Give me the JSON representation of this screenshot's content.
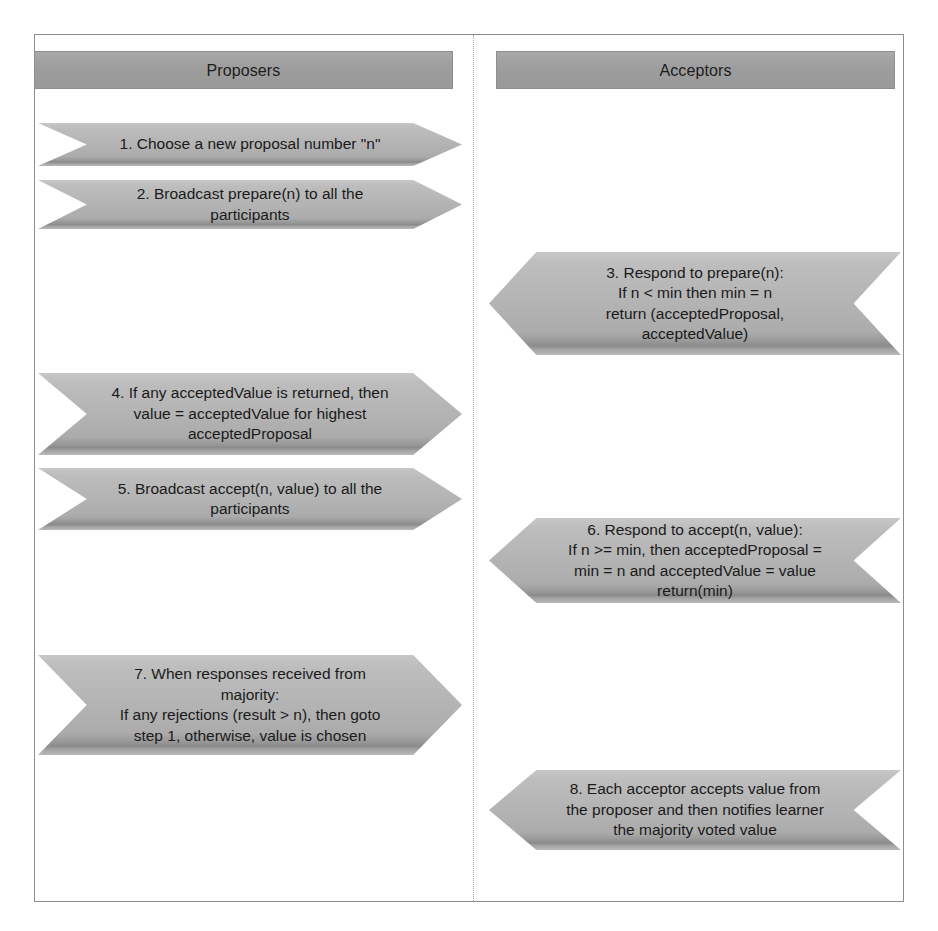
{
  "diagram": {
    "colors": {
      "header_fill": "#9d9d9d",
      "arrow_fill": "#b2b2b2",
      "arrow_shadow": "#8b8b8b",
      "frame_border": "#8d8d8d",
      "divider": "#a8a8a8",
      "text": "#1a1a1a"
    },
    "lanes": [
      {
        "id": "proposers",
        "label": "Proposers",
        "arrow_direction": "right"
      },
      {
        "id": "acceptors",
        "label": "Acceptors",
        "arrow_direction": "left"
      }
    ],
    "steps": [
      {
        "number": "1",
        "lane": "proposers",
        "direction": "right",
        "text": "1. Choose a new proposal number \"n\""
      },
      {
        "number": "2",
        "lane": "proposers",
        "direction": "right",
        "text": "2. Broadcast prepare(n) to all the\nparticipants"
      },
      {
        "number": "3",
        "lane": "acceptors",
        "direction": "left",
        "text": "3. Respond to prepare(n):\nIf n < min then min = n\nreturn (acceptedProposal,\nacceptedValue)"
      },
      {
        "number": "4",
        "lane": "proposers",
        "direction": "right",
        "text": "4. If any acceptedValue is returned, then\nvalue = acceptedValue for highest\nacceptedProposal"
      },
      {
        "number": "5",
        "lane": "proposers",
        "direction": "right",
        "text": "5. Broadcast accept(n, value) to all the\nparticipants"
      },
      {
        "number": "6",
        "lane": "acceptors",
        "direction": "left",
        "text": "6. Respond to accept(n, value):\nIf n >= min, then acceptedProposal =\nmin = n and acceptedValue = value\nreturn(min)"
      },
      {
        "number": "7",
        "lane": "proposers",
        "direction": "right",
        "text": "7. When responses received from\nmajority:\nIf any rejections (result > n), then goto\nstep 1, otherwise, value is chosen"
      },
      {
        "number": "8",
        "lane": "acceptors",
        "direction": "left",
        "text": "8. Each acceptor accepts value from\nthe proposer and then notifies learner\nthe majority voted value"
      }
    ]
  }
}
